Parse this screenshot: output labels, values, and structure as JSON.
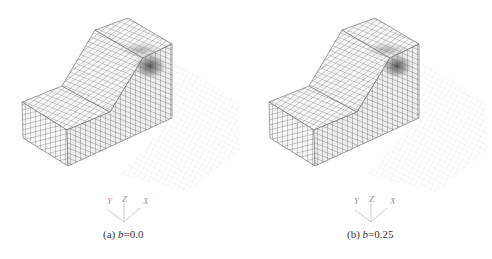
{
  "figure": {
    "panels": [
      {
        "id": "a",
        "caption_prefix": "(a) ",
        "caption_var": "b",
        "caption_value": "=0.0",
        "axes": {
          "y": "Y",
          "z": "Z",
          "x": "X"
        }
      },
      {
        "id": "b",
        "caption_prefix": "(b) ",
        "caption_var": "b",
        "caption_value": "=0.25",
        "axes": {
          "y": "Y",
          "z": "Z",
          "x": "X"
        }
      }
    ]
  },
  "colors": {
    "mesh_line": "#555555",
    "face_fill": "#f4f4f4",
    "stress_dark": "#4a4a4a",
    "ghost_grid": "#dddddd",
    "caption_text": "#333333",
    "axis_text": "#999999"
  }
}
